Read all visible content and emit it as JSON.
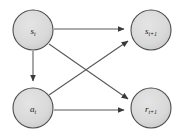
{
  "diagram": {
    "background_color": "#ffffff",
    "node_fill_color": "#d9d9d9",
    "node_stroke_color": "#4d4d4d",
    "edge_color": "#585858",
    "nodes": [
      {
        "id": "s-t",
        "label": "s",
        "subscript": "t",
        "full_label": "s_t",
        "cx": 33,
        "cy": 30,
        "r": 20
      },
      {
        "id": "s-t-plus-1",
        "label": "s",
        "subscript": "t+1",
        "full_label": "s_t+1",
        "cx": 151,
        "cy": 30,
        "r": 20
      },
      {
        "id": "a-t",
        "label": "a",
        "subscript": "t",
        "full_label": "a_t",
        "cx": 33,
        "cy": 108,
        "r": 20
      },
      {
        "id": "r-t-plus-1",
        "label": "r",
        "subscript": "t+1",
        "full_label": "r_t+1",
        "cx": 151,
        "cy": 108,
        "r": 20
      }
    ],
    "edges": [
      {
        "id": "edge-st-to-st1",
        "from": "s-t",
        "to": "s-t-plus-1",
        "kind": "horizontal-top"
      },
      {
        "id": "edge-st-to-at",
        "from": "s-t",
        "to": "a-t",
        "kind": "vertical-left"
      },
      {
        "id": "edge-st-to-rt1",
        "from": "s-t",
        "to": "r-t-plus-1",
        "kind": "diagonal-down"
      },
      {
        "id": "edge-at-to-st1",
        "from": "a-t",
        "to": "s-t-plus-1",
        "kind": "diagonal-up"
      },
      {
        "id": "edge-at-to-rt1",
        "from": "a-t",
        "to": "r-t-plus-1",
        "kind": "horizontal-bottom"
      }
    ]
  }
}
